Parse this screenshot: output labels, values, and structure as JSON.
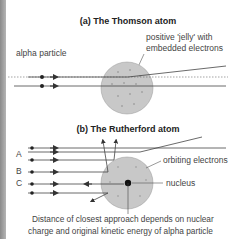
{
  "diagram": {
    "thomson": {
      "title": "(a) The Thomson atom",
      "label_particle": "alpha particle",
      "label_jelly_1": "positive 'jelly' with",
      "label_jelly_2": "embedded electrons"
    },
    "rutherford": {
      "title": "(b) The Rutherford atom",
      "label_a": "A",
      "label_b": "B",
      "label_c": "C",
      "label_electrons": "orbiting electrons",
      "label_nucleus": "nucleus",
      "caption_1": "Distance of closest approach depends on nuclear",
      "caption_2": "charge and original kinetic energy of alpha particle"
    },
    "colors": {
      "atom_fill": "#c8c8c8",
      "line": "#555555",
      "strip": "#9a9a9a"
    }
  }
}
